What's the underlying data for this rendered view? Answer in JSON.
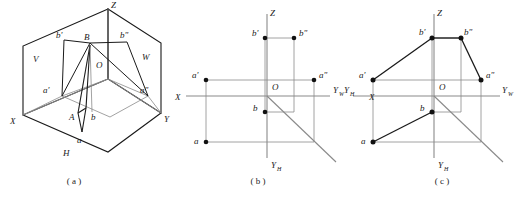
{
  "figure": {
    "captions": [
      {
        "key": "a",
        "text": "( a )"
      },
      {
        "key": "b",
        "text": "( b )"
      },
      {
        "key": "c",
        "text": "( c )"
      }
    ]
  },
  "colors": {
    "line_dark": "#1a1a1a",
    "line_gray": "#8a8a8a",
    "background": "#ffffff",
    "point_fill": "#111111"
  },
  "panel_a": {
    "caption": "( a )",
    "plane_labels": [
      {
        "name": "V",
        "text": "V"
      },
      {
        "name": "W",
        "text": "W"
      },
      {
        "name": "H",
        "text": "H"
      }
    ],
    "axis_labels": [
      {
        "name": "Z",
        "text": "Z"
      },
      {
        "name": "X",
        "text": "X"
      },
      {
        "name": "Y",
        "text": "Y"
      }
    ],
    "origin_label": "O",
    "point_labels": [
      {
        "name": "A",
        "text": "A"
      },
      {
        "name": "B",
        "text": "B"
      },
      {
        "name": "a",
        "text": "a"
      },
      {
        "name": "b",
        "text": "b"
      },
      {
        "name": "a-prime",
        "text": "a'"
      },
      {
        "name": "b-prime",
        "text": "b'"
      },
      {
        "name": "a-double-prime",
        "text": "a\""
      },
      {
        "name": "b-double-prime",
        "text": "b\""
      }
    ]
  },
  "panel_b": {
    "caption": "( b )",
    "axis_labels": [
      {
        "name": "Z",
        "text": "Z"
      },
      {
        "name": "X",
        "text": "X"
      },
      {
        "name": "Y-W",
        "text": "Y",
        "sub": "W"
      },
      {
        "name": "Y-H",
        "text": "Y",
        "sub": "H"
      }
    ],
    "origin_label": "O",
    "point_labels": [
      {
        "name": "b-prime",
        "text": "b'"
      },
      {
        "name": "b-double-prime",
        "text": "b\""
      },
      {
        "name": "a-prime",
        "text": "a'"
      },
      {
        "name": "a-double-prime",
        "text": "a\""
      },
      {
        "name": "b",
        "text": "b"
      },
      {
        "name": "a",
        "text": "a"
      }
    ]
  },
  "panel_c": {
    "caption": "( c )",
    "axis_labels": [
      {
        "name": "Z",
        "text": "Z"
      },
      {
        "name": "X",
        "text": "X"
      },
      {
        "name": "Y-W",
        "text": "Y",
        "sub": "W"
      },
      {
        "name": "Y-H-left",
        "text": "Y",
        "sub": "H"
      },
      {
        "name": "Y-H-bottom",
        "text": "Y",
        "sub": "H"
      }
    ],
    "origin_label": "O",
    "point_labels": [
      {
        "name": "b-prime",
        "text": "b'"
      },
      {
        "name": "b-double-prime",
        "text": "b\""
      },
      {
        "name": "a-prime",
        "text": "a'"
      },
      {
        "name": "a-double-prime",
        "text": "a\""
      },
      {
        "name": "b",
        "text": "b"
      },
      {
        "name": "a",
        "text": "a"
      }
    ]
  }
}
